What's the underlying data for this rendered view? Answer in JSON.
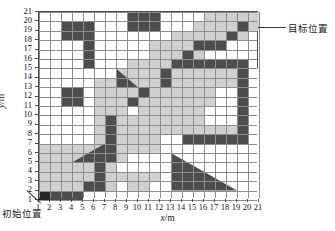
{
  "figure": {
    "type": "grid-occupancy-map",
    "x_axis": {
      "title": "x",
      "unit": "/m",
      "min": 1,
      "max": 21,
      "ticks": [
        1,
        2,
        3,
        4,
        5,
        6,
        7,
        8,
        9,
        10,
        11,
        12,
        13,
        14,
        15,
        16,
        17,
        18,
        19,
        20,
        21
      ]
    },
    "y_axis": {
      "title": "y",
      "unit": "/m",
      "min": 1,
      "max": 21,
      "ticks": [
        1,
        2,
        3,
        4,
        5,
        6,
        7,
        8,
        9,
        10,
        11,
        12,
        13,
        14,
        15,
        16,
        17,
        18,
        19,
        20,
        21
      ]
    }
  },
  "annotations": {
    "goal_label": "目标位置",
    "start_label": "初始位置"
  },
  "colors": {
    "obstacle": "#4d4d4d",
    "inflated": "#cfcfcf",
    "free": "#ffffff",
    "start_cell": "#262626",
    "grid_line": "#8c8c8c",
    "axis": "#4a4a4a"
  },
  "chart_data": {
    "type": "heatmap",
    "title": "",
    "xlabel": "x/m",
    "ylabel": "y/m",
    "xlim": [
      1,
      21
    ],
    "ylim": [
      1,
      21
    ],
    "legend_position": "right",
    "legend": [
      "目标位置",
      "初始位置"
    ],
    "start_cell": [
      1,
      1
    ],
    "goal_cell": [
      20,
      20
    ],
    "categories": [
      "free",
      "inflated",
      "obstacle"
    ],
    "obstacle_cells": [
      [
        3,
        18
      ],
      [
        4,
        18
      ],
      [
        5,
        18
      ],
      [
        3,
        19
      ],
      [
        4,
        19
      ],
      [
        5,
        19
      ],
      [
        5,
        17
      ],
      [
        5,
        16
      ],
      [
        5,
        15
      ],
      [
        9,
        20
      ],
      [
        10,
        20
      ],
      [
        11,
        20
      ],
      [
        9,
        19
      ],
      [
        10,
        19
      ],
      [
        11,
        19
      ],
      [
        3,
        11
      ],
      [
        4,
        11
      ],
      [
        3,
        12
      ],
      [
        4,
        12
      ],
      [
        7,
        9
      ],
      [
        7,
        8
      ],
      [
        7,
        7
      ],
      [
        7,
        6
      ],
      [
        7,
        5
      ],
      [
        6,
        4
      ],
      [
        6,
        3
      ],
      [
        10,
        12
      ],
      [
        9,
        11
      ],
      [
        12,
        14
      ],
      [
        12,
        13
      ],
      [
        13,
        15
      ],
      [
        14,
        16
      ],
      [
        15,
        17
      ],
      [
        16,
        17
      ],
      [
        17,
        17
      ],
      [
        18,
        18
      ],
      [
        19,
        19
      ],
      [
        14,
        15
      ],
      [
        15,
        15
      ],
      [
        16,
        15
      ],
      [
        17,
        15
      ],
      [
        18,
        15
      ],
      [
        19,
        15
      ],
      [
        19,
        14
      ],
      [
        19,
        13
      ],
      [
        19,
        12
      ],
      [
        19,
        11
      ],
      [
        19,
        10
      ],
      [
        19,
        9
      ],
      [
        19,
        8
      ],
      [
        19,
        7
      ],
      [
        18,
        7
      ],
      [
        17,
        7
      ],
      [
        16,
        7
      ],
      [
        15,
        7
      ],
      [
        14,
        7
      ],
      [
        2,
        1
      ],
      [
        3,
        1
      ],
      [
        4,
        1
      ],
      [
        1,
        1
      ]
    ],
    "inflated_cells": [
      [
        6,
        10
      ],
      [
        6,
        9
      ],
      [
        6,
        8
      ],
      [
        6,
        7
      ],
      [
        6,
        6
      ],
      [
        7,
        10
      ],
      [
        8,
        10
      ],
      [
        8,
        11
      ],
      [
        8,
        12
      ],
      [
        8,
        13
      ],
      [
        9,
        12
      ],
      [
        9,
        13
      ],
      [
        10,
        13
      ],
      [
        10,
        14
      ],
      [
        11,
        14
      ],
      [
        11,
        15
      ],
      [
        11,
        16
      ],
      [
        12,
        16
      ],
      [
        12,
        15
      ],
      [
        13,
        16
      ],
      [
        13,
        17
      ],
      [
        14,
        17
      ],
      [
        14,
        18
      ],
      [
        15,
        18
      ],
      [
        16,
        18
      ],
      [
        17,
        18
      ],
      [
        18,
        19
      ],
      [
        19,
        20
      ],
      [
        1,
        6
      ],
      [
        2,
        6
      ],
      [
        3,
        6
      ],
      [
        4,
        6
      ],
      [
        5,
        6
      ],
      [
        1,
        5
      ],
      [
        2,
        5
      ],
      [
        3,
        5
      ],
      [
        4,
        5
      ],
      [
        5,
        5
      ],
      [
        1,
        4
      ],
      [
        2,
        4
      ],
      [
        3,
        4
      ],
      [
        4,
        4
      ],
      [
        5,
        4
      ],
      [
        1,
        3
      ],
      [
        2,
        3
      ],
      [
        3,
        3
      ],
      [
        4,
        3
      ],
      [
        5,
        3
      ],
      [
        1,
        2
      ],
      [
        2,
        2
      ],
      [
        3,
        2
      ],
      [
        4,
        2
      ],
      [
        5,
        2
      ]
    ]
  }
}
